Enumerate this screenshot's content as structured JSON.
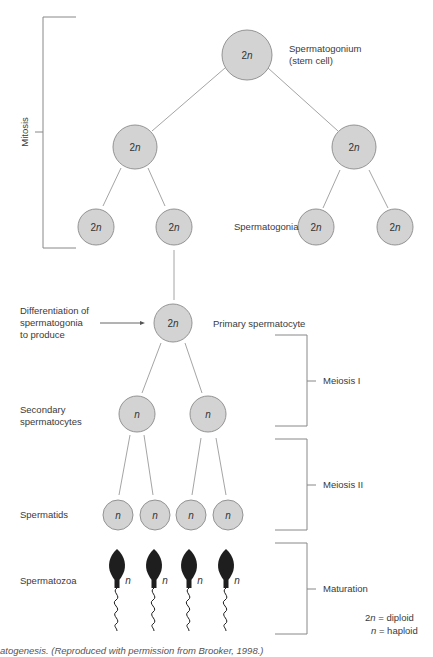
{
  "diagram": {
    "type": "spermatogenesis-lineage",
    "colors": {
      "cell_fill": "#d3d3d3",
      "cell_stroke": "#8a8a8a",
      "line": "#9a9a9a",
      "sperm": "#1e1e1e",
      "text": "#3a3a3a"
    },
    "cells": {
      "stem": {
        "label_num": "2",
        "label_var": "n"
      },
      "mitosis_l2": [
        {
          "label_num": "2",
          "label_var": "n"
        },
        {
          "label_num": "2",
          "label_var": "n"
        }
      ],
      "mitosis_l3": [
        {
          "label_num": "2",
          "label_var": "n"
        },
        {
          "label_num": "2",
          "label_var": "n"
        },
        {
          "label_num": "2",
          "label_var": "n"
        },
        {
          "label_num": "2",
          "label_var": "n"
        }
      ],
      "primary": {
        "label_num": "2",
        "label_var": "n"
      },
      "secondary": [
        {
          "label_var": "n"
        },
        {
          "label_var": "n"
        }
      ],
      "spermatids": [
        {
          "label_var": "n"
        },
        {
          "label_var": "n"
        },
        {
          "label_var": "n"
        },
        {
          "label_var": "n"
        }
      ],
      "spermatozoa": [
        {
          "label_var": "n"
        },
        {
          "label_var": "n"
        },
        {
          "label_var": "n"
        },
        {
          "label_var": "n"
        }
      ]
    },
    "labels": {
      "spermatogonium": "Spermatogonium\n(stem cell)",
      "spermatogonia": "Spermatogonia",
      "differentiation": "Differentiation of\nspermatogonia\nto produce",
      "primary_spermatocyte": "Primary spermatocyte",
      "secondary_spermatocytes": "Secondary\nspermatocytes",
      "spermatids": "Spermatids",
      "spermatozoa": "Spermatozoa"
    },
    "brackets": {
      "mitosis": "Mitosis",
      "meiosis_1": "Meiosis I",
      "meiosis_2": "Meiosis II",
      "maturation": "Maturation"
    },
    "legend": {
      "diploid": {
        "num": "2",
        "var": "n",
        "text": " = diploid"
      },
      "haploid": {
        "var": "n",
        "text": " = haploid"
      }
    },
    "caption": "atogenesis. (Reproduced with permission from Brooker, 1998.)"
  }
}
